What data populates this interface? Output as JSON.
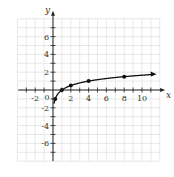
{
  "chart_data": {
    "type": "line",
    "title": "",
    "xlabel": "x",
    "ylabel": "y",
    "xlim": [
      -4,
      12
    ],
    "ylim": [
      -8,
      8
    ],
    "grid": true,
    "x_ticks": [
      -2,
      2,
      4,
      6,
      8,
      10
    ],
    "y_ticks": [
      -6,
      -4,
      -2,
      2,
      4,
      6
    ],
    "x_tick_labels": [
      "-2",
      "2",
      "4",
      "6",
      "8",
      "10"
    ],
    "y_tick_labels": [
      "-6",
      "-4",
      "-2",
      "2",
      "4",
      "6"
    ],
    "origin_label": "0",
    "series": [
      {
        "name": "curve",
        "function": "y = log4(x)",
        "x": [
          0.25,
          1,
          2,
          4,
          8,
          11
        ],
        "y": [
          -1,
          0,
          0.5,
          1,
          1.5,
          1.73
        ],
        "points_marked": [
          [
            0.25,
            -1
          ],
          [
            1,
            0
          ],
          [
            2,
            0.5
          ],
          [
            4,
            1
          ],
          [
            8,
            1.5
          ]
        ],
        "arrow_end": true
      }
    ]
  },
  "colors": {
    "grid": "#d8d8d8",
    "axis": "#222222",
    "curve": "#111111"
  }
}
